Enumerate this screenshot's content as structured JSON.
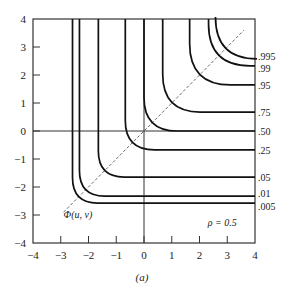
{
  "chart_data": {
    "type": "line",
    "title": "",
    "subtitle": "(a)",
    "xlabel": "",
    "ylabel": "",
    "xlim": [
      -4,
      4
    ],
    "ylim": [
      -4,
      4
    ],
    "grid": false,
    "x_ticks": [
      "-4",
      "-3",
      "-2",
      "-1",
      "0",
      "1",
      "2",
      "3",
      "4"
    ],
    "y_ticks": [
      "4",
      "3",
      "2",
      "1",
      "0",
      "-1",
      "-2",
      "-3",
      "-4"
    ],
    "annotations": [
      {
        "text": "Φ(u, v)",
        "x": -2.9,
        "y": -3.1
      },
      {
        "text": "ρ = 0.5",
        "x": 2.3,
        "y": -3.4
      }
    ],
    "diagonal_line": {
      "style": "dashed",
      "from": [
        -2.9,
        -2.9
      ],
      "to": [
        3.6,
        3.6
      ]
    },
    "series": [
      {
        "name": ".005",
        "level": 0.005,
        "asymptote": -2.576
      },
      {
        "name": ".01",
        "level": 0.01,
        "asymptote": -2.326
      },
      {
        "name": ".05",
        "level": 0.05,
        "asymptote": -1.645
      },
      {
        "name": ".25",
        "level": 0.25,
        "asymptote": -0.674
      },
      {
        "name": ".50",
        "level": 0.5,
        "asymptote": 0.0
      },
      {
        "name": ".75",
        "level": 0.75,
        "asymptote": 0.674
      },
      {
        "name": ".95",
        "level": 0.95,
        "asymptote": 1.645
      },
      {
        "name": ".99",
        "level": 0.99,
        "asymptote": 2.326
      },
      {
        "name": ".995",
        "level": 0.995,
        "asymptote": 2.576
      }
    ],
    "rho": 0.5
  }
}
